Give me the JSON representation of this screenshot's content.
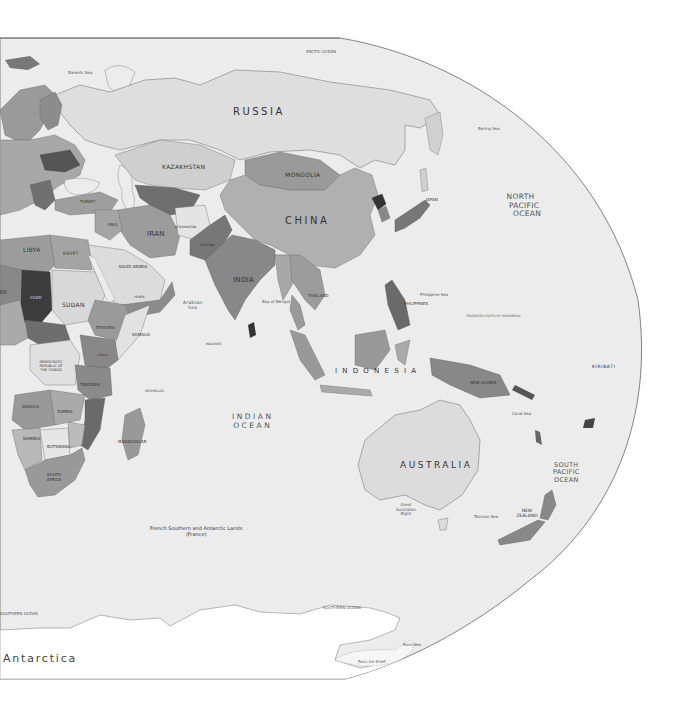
{
  "map": {
    "projection_shape": "elliptical-right-edge",
    "colors": {
      "ocean": "#ececec",
      "land_light": "#dcdcdc",
      "land_mid": "#b4b4b4",
      "land_dark": "#8a8a8a",
      "land_darker": "#5e5e5e",
      "land_darkest": "#3a3a3a",
      "antarctica": "#ffffff",
      "border": "#555555",
      "background": "#ffffff"
    },
    "large_country_labels": {
      "russia": "RUSSIA",
      "china": "CHINA",
      "australia": "AUSTRALIA",
      "indonesia": "I N D O N E S I A"
    },
    "country_labels": {
      "kazakhstan": "KAZAKHSTAN",
      "mongolia": "MONGOLIA",
      "iran": "IRAN",
      "india": "INDIA",
      "libya": "LIBYA",
      "egypt": "EGYPT",
      "sudan": "SUDAN",
      "chad": "CHAD",
      "ethiopia": "ETHIOPIA",
      "somalia": "SOMALIA",
      "saudi_arabia": "SAUDI ARABIA",
      "dr_congo": "DEMOCRATIC REPUBLIC OF THE CONGO",
      "tanzania": "TANZANIA",
      "angola": "ANGOLA",
      "zambia": "ZAMBIA",
      "namibia": "NAMIBIA",
      "botswana": "BOTSWANA",
      "south_africa": "SOUTH AFRICA",
      "madagascar": "MADAGASCAR",
      "thailand": "THAILAND",
      "philippines": "PHILIPPINES",
      "japan": "JAPAN",
      "new_guinea": "NEW GUINEA",
      "new_zealand": "NEW ZEALAND",
      "kiribati": "KIRIBATI",
      "afghanistan": "AFGHANISTAN",
      "pakistan": "PAKISTAN",
      "iraq": "IRAQ",
      "turkey": "TURKEY",
      "niger_partial": "ER",
      "yemen": "YEMEN",
      "kenya": "KENYA",
      "maldives": "MALDIVES",
      "seychelles": "SEYCHELLES"
    },
    "ocean_labels": {
      "north_pacific": [
        "NORTH",
        "PACIFIC",
        "OCEAN"
      ],
      "south_pacific": [
        "SOUTH",
        "PACIFIC",
        "OCEAN"
      ],
      "indian_ocean": [
        "INDIAN",
        "OCEAN"
      ],
      "arabian_sea": [
        "Arabian",
        "Sea"
      ],
      "arctic_ocean": "ARCTIC OCEAN",
      "southern_ocean_west": "SOUTHERN OCEAN",
      "southern_ocean_east": "SOUTHERN OCEAN",
      "barents_sea": "Barents Sea",
      "bering_sea": "Bering Sea",
      "philippine_sea": "Philippine Sea",
      "tasman_sea": "Tasman Sea",
      "great_australian_bight": "Great Australian Bight",
      "coral_sea": "Coral Sea",
      "ross_sea": "Ross Sea",
      "ross_ice_shelf": "Ross Ice Shelf",
      "bay_of_bengal": "Bay of Bengal",
      "micronesia": "FEDERATED STATES OF MICRONESIA"
    },
    "territory_labels": {
      "french_southern": [
        "French Southern and Antarctic Lands",
        "(France)"
      ]
    },
    "continent_labels": {
      "antarctica": "Antarctica"
    }
  }
}
